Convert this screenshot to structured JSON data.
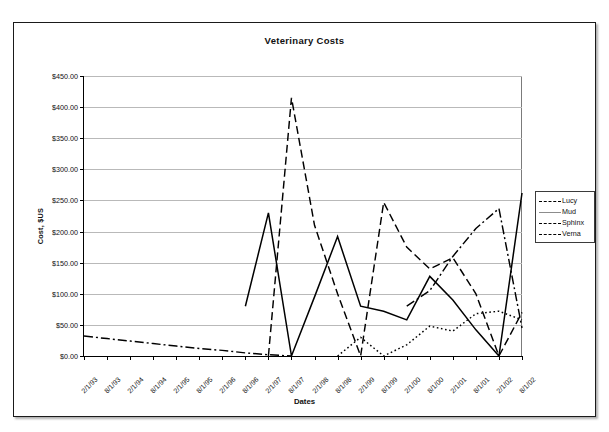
{
  "chart_data": {
    "type": "line",
    "title": "Veterinary Costs",
    "xlabel": "Dates",
    "ylabel": "Cost, $US",
    "ylim": [
      0,
      450
    ],
    "ytick_step": 50,
    "grid": true,
    "legend_position": "right",
    "ytick_labels": [
      "$0.00",
      "$50.00",
      "$100.00",
      "$150.00",
      "$200.00",
      "$250.00",
      "$300.00",
      "$350.00",
      "$400.00",
      "$450.00"
    ],
    "ytick_values": [
      0,
      50,
      100,
      150,
      200,
      250,
      300,
      350,
      400,
      450
    ],
    "categories": [
      "2/1/93",
      "8/1/93",
      "2/1/94",
      "8/1/94",
      "2/1/95",
      "8/1/95",
      "2/1/96",
      "8/1/96",
      "2/1/97",
      "8/1/97",
      "2/1/98",
      "8/1/98",
      "2/1/99",
      "8/1/99",
      "2/1/00",
      "8/1/00",
      "2/1/01",
      "8/1/01",
      "2/1/02",
      "8/1/02"
    ],
    "series": [
      {
        "name": "Lucy",
        "style": "dashed",
        "color": "#000000",
        "values": [
          null,
          null,
          null,
          null,
          null,
          null,
          null,
          null,
          0,
          415,
          210,
          100,
          0,
          247,
          175,
          140,
          158,
          100,
          0,
          70
        ]
      },
      {
        "name": "Mud",
        "style": "solid",
        "color": "#000000",
        "values": [
          null,
          null,
          null,
          null,
          null,
          null,
          null,
          80,
          230,
          0,
          95,
          192,
          80,
          72,
          58,
          128,
          90,
          42,
          0,
          262
        ]
      },
      {
        "name": "Sphinx",
        "style": "dotted",
        "color": "#000000",
        "values": [
          null,
          null,
          null,
          null,
          null,
          null,
          null,
          null,
          null,
          null,
          null,
          0,
          30,
          0,
          18,
          48,
          40,
          68,
          72,
          58
        ]
      },
      {
        "name": "Verna",
        "style": "dashdot",
        "color": "#000000",
        "values": [
          32,
          28,
          24,
          20,
          16,
          12,
          9,
          5,
          2,
          0,
          null,
          null,
          null,
          null,
          80,
          105,
          160,
          205,
          237,
          45
        ]
      }
    ]
  },
  "legend": {
    "entries": [
      {
        "label": "Lucy"
      },
      {
        "label": "Mud"
      },
      {
        "label": "Sphinx"
      },
      {
        "label": "Verna"
      }
    ]
  }
}
